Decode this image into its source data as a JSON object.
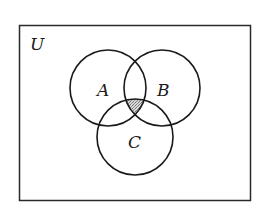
{
  "diagram": {
    "type": "venn",
    "universe_label": "U",
    "sets": [
      {
        "label": "A",
        "cx": 108,
        "cy": 88,
        "r": 38
      },
      {
        "label": "B",
        "cx": 162,
        "cy": 88,
        "r": 38
      },
      {
        "label": "C",
        "cx": 135,
        "cy": 137,
        "r": 38
      }
    ],
    "shaded_region": "A ∩ B ∩ C",
    "colors": {
      "stroke": "#1a1a1a",
      "shade": "#b8b8b8",
      "background": "#ffffff"
    }
  }
}
